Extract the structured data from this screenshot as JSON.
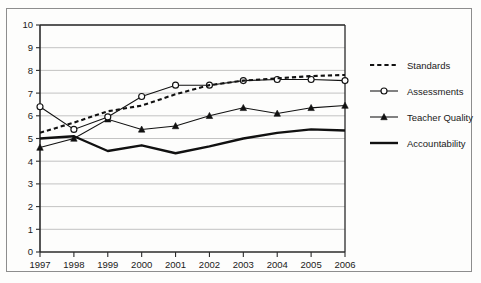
{
  "chart_data": {
    "type": "line",
    "title": "",
    "xlabel": "",
    "ylabel": "",
    "categories": [
      "1997",
      "1998",
      "1999",
      "2000",
      "2001",
      "2002",
      "2003",
      "2004",
      "2005",
      "2006"
    ],
    "x": [
      1997,
      1998,
      1999,
      2000,
      2001,
      2002,
      2003,
      2004,
      2005,
      2006
    ],
    "ylim": [
      0,
      10
    ],
    "xlim": [
      1997,
      2006
    ],
    "yticks": [
      0,
      1,
      2,
      3,
      4,
      5,
      6,
      7,
      8,
      9,
      10
    ],
    "ytick_labels": [
      "0",
      "1",
      "2",
      "3",
      "4",
      "5",
      "6",
      "7",
      "8",
      "9",
      "10"
    ],
    "grid": true,
    "grid_axis": "y",
    "legend_position": "right",
    "series": [
      {
        "name": "Standards",
        "style": "dashed",
        "marker": "none",
        "color": "#111111",
        "values": [
          5.25,
          5.7,
          6.2,
          6.45,
          6.95,
          7.35,
          7.55,
          7.65,
          7.75,
          7.8
        ]
      },
      {
        "name": "Assessments",
        "style": "solid-thin",
        "marker": "open-circle",
        "color": "#111111",
        "values": [
          6.4,
          5.4,
          5.95,
          6.85,
          7.35,
          7.35,
          7.55,
          7.6,
          7.6,
          7.55
        ]
      },
      {
        "name": "Teacher Quality",
        "style": "solid-thin",
        "marker": "filled-triangle",
        "color": "#111111",
        "values": [
          4.6,
          5.0,
          5.85,
          5.4,
          5.55,
          6.0,
          6.35,
          6.1,
          6.35,
          6.45
        ]
      },
      {
        "name": "Accountability",
        "style": "solid-thick",
        "marker": "none",
        "color": "#111111",
        "values": [
          5.0,
          5.1,
          4.45,
          4.7,
          4.35,
          4.65,
          5.0,
          5.25,
          5.4,
          5.35
        ]
      }
    ]
  },
  "legend": {
    "items": [
      {
        "label": "Standards"
      },
      {
        "label": "Assessments"
      },
      {
        "label": "Teacher Quality"
      },
      {
        "label": "Accountability"
      }
    ]
  },
  "colors": {
    "ink": "#111111",
    "grid": "#b4b4b4",
    "frame": "#8d8d8d",
    "background": "#fdfdfc"
  }
}
